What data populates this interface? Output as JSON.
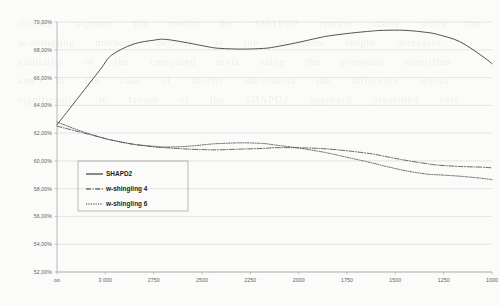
{
  "chart_data": {
    "type": "line",
    "title": "",
    "xlabel": "",
    "ylabel": "",
    "xlim": [
      3000,
      1000
    ],
    "ylim": [
      52,
      70
    ],
    "x_tick_labels": [
      "oo",
      "3 000",
      "2750",
      "2500",
      "2250",
      "2000",
      "1750",
      "1500",
      "1250",
      "1000"
    ],
    "y_tick_labels": [
      "70,00%",
      "68,00%",
      "66,00%",
      "64,00%",
      "62,00%",
      "60,00%",
      "58,00%",
      "56,00%",
      "54,00%",
      "52,00%"
    ],
    "y_tick_values": [
      70,
      68,
      66,
      64,
      62,
      60,
      58,
      56,
      54,
      52
    ],
    "grid": true,
    "legend_position": "lower-left",
    "x_axis_direction": "descending",
    "series": [
      {
        "name": "SHAPD2",
        "line_style": "solid",
        "color": "#4a4a4a",
        "x": [
          3000,
          2900,
          2800,
          2750,
          2650,
          2550,
          2500,
          2400,
          2300,
          2250,
          2150,
          2050,
          2000,
          1900,
          1800,
          1750,
          1650,
          1550,
          1500,
          1400,
          1300,
          1250,
          1150,
          1050,
          1000
        ],
        "y": [
          62.6,
          64.6,
          66.6,
          67.6,
          68.4,
          68.7,
          68.75,
          68.5,
          68.2,
          68.1,
          68.05,
          68.1,
          68.2,
          68.5,
          68.85,
          69.0,
          69.2,
          69.35,
          69.4,
          69.4,
          69.25,
          69.1,
          68.6,
          67.6,
          67.0
        ]
      },
      {
        "name": "w-shingling 4",
        "line_style": "dash-dot",
        "color": "#4a4a4a",
        "x": [
          3000,
          2900,
          2800,
          2750,
          2650,
          2550,
          2500,
          2400,
          2300,
          2250,
          2150,
          2050,
          2000,
          1900,
          1800,
          1750,
          1650,
          1550,
          1500,
          1400,
          1300,
          1250,
          1150,
          1050,
          1000
        ],
        "y": [
          62.5,
          62.1,
          61.7,
          61.5,
          61.2,
          61.0,
          60.95,
          60.85,
          60.8,
          60.8,
          60.85,
          60.9,
          60.95,
          60.95,
          60.9,
          60.85,
          60.7,
          60.5,
          60.35,
          60.05,
          59.8,
          59.7,
          59.6,
          59.55,
          59.5
        ]
      },
      {
        "name": "w-shingling 6",
        "line_style": "dotted",
        "color": "#4a4a4a",
        "x": [
          3000,
          2900,
          2800,
          2750,
          2650,
          2550,
          2500,
          2400,
          2300,
          2250,
          2150,
          2050,
          2000,
          1900,
          1800,
          1750,
          1650,
          1550,
          1500,
          1400,
          1300,
          1250,
          1150,
          1050,
          1000
        ],
        "y": [
          62.8,
          62.2,
          61.7,
          61.5,
          61.2,
          61.05,
          61.0,
          61.05,
          61.2,
          61.25,
          61.3,
          61.25,
          61.15,
          60.95,
          60.7,
          60.55,
          60.2,
          59.85,
          59.65,
          59.3,
          59.05,
          59.0,
          58.9,
          58.75,
          58.65
        ]
      }
    ],
    "legend": [
      {
        "label": "SHAPD2",
        "line_style": "solid"
      },
      {
        "label": "w-shingling 4",
        "line_style": "dash-dot"
      },
      {
        "label": "w-shingling 6",
        "line_style": "dotted"
      }
    ]
  },
  "background_text": "disjoint  n-grams  the  results  for  SHAPD2  remain  stable  while  the\nw-shingling  methods  degrade  as  the  document  length  decreases.\nsimilarity  of  the  compared  texts  using  the  proposed  algorithm\nand  in  the  case  of  shorter  documents  the  difference  grows\nsignificantly  in  favour  of  the  SHAPD2  approach  presented  here"
}
